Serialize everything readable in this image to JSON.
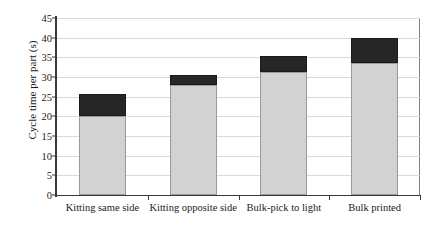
{
  "chart_data": {
    "type": "bar",
    "subtype": "stacked-bar",
    "title": "",
    "xlabel": "",
    "ylabel": "Cycle time per part (s)",
    "categories": [
      "Kitting same side",
      "Kitting opposite side",
      "Bulk-pick to light",
      "Bulk printed"
    ],
    "series": [
      {
        "name": "lower-segment",
        "color": "#d2d2d2",
        "values": [
          20.0,
          28.0,
          31.3,
          33.6
        ]
      },
      {
        "name": "upper-segment",
        "color": "#262626",
        "values": [
          5.6,
          2.6,
          4.1,
          6.4
        ]
      }
    ],
    "totals": [
      25.6,
      30.6,
      35.4,
      40.0
    ],
    "ylim": [
      0,
      45
    ],
    "ytick_values": [
      0,
      5,
      10,
      15,
      20,
      25,
      30,
      35,
      40,
      45
    ],
    "ytick_labels": [
      "0",
      "5",
      "10",
      "15",
      "20",
      "25",
      "30",
      "35",
      "40",
      "45"
    ],
    "grid": true,
    "grid_axis": "y",
    "legend": false,
    "legend_position": "none",
    "annotations": []
  },
  "colors": {
    "lower_fill": "#d2d2d2",
    "lower_border": "#9a9a9a",
    "upper_fill": "#262626",
    "upper_border": "#1a1a1a",
    "gridline": "#d9d9d9",
    "axis": "#3a3a3a",
    "text": "#1a1a1a",
    "background": "#ffffff"
  }
}
